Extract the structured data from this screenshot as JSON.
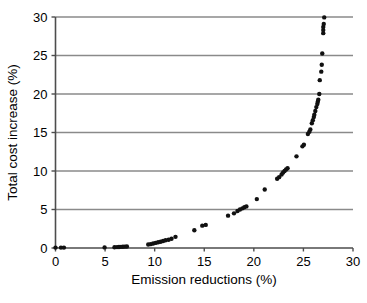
{
  "chart_data": {
    "type": "scatter",
    "title": "",
    "subtitle": "",
    "xlabel": "Emission reductions (%)",
    "ylabel": "Total cost increase (%)",
    "xlim": [
      0,
      30
    ],
    "ylim": [
      0,
      30
    ],
    "xticks": [
      "0",
      "5",
      "10",
      "15",
      "20",
      "25",
      "30"
    ],
    "yticks": [
      "0",
      "5",
      "10",
      "15",
      "20",
      "25",
      "30"
    ],
    "xtick_values": [
      0,
      5,
      10,
      15,
      20,
      25,
      30
    ],
    "ytick_values": [
      0,
      5,
      10,
      15,
      20,
      25,
      30
    ],
    "grid": "horizontal",
    "gridlines_y": [
      5,
      10,
      15,
      20,
      25,
      30
    ],
    "legend": null,
    "legend_position": "none",
    "annotations": [],
    "marker": {
      "shape": "circle",
      "color": "#111111",
      "size_px": 4.4,
      "filled": true
    },
    "axis_color": "#4d4d4d",
    "grid_color": "#8a8a8a",
    "series": [
      {
        "name": "Marginal abatement cost curve",
        "points": [
          [
            0.0,
            0.05
          ],
          [
            0.55,
            0.05
          ],
          [
            0.85,
            0.05
          ],
          [
            4.95,
            0.08
          ],
          [
            5.95,
            0.1
          ],
          [
            6.2,
            0.12
          ],
          [
            6.4,
            0.13
          ],
          [
            6.6,
            0.15
          ],
          [
            6.8,
            0.16
          ],
          [
            7.0,
            0.18
          ],
          [
            7.2,
            0.2
          ],
          [
            9.35,
            0.45
          ],
          [
            9.6,
            0.5
          ],
          [
            9.85,
            0.58
          ],
          [
            10.1,
            0.66
          ],
          [
            10.35,
            0.74
          ],
          [
            10.6,
            0.82
          ],
          [
            10.85,
            0.9
          ],
          [
            11.1,
            1.0
          ],
          [
            11.4,
            1.08
          ],
          [
            11.7,
            1.2
          ],
          [
            12.1,
            1.45
          ],
          [
            14.0,
            2.3
          ],
          [
            14.8,
            2.9
          ],
          [
            15.15,
            3.0
          ],
          [
            17.4,
            4.2
          ],
          [
            18.0,
            4.5
          ],
          [
            18.35,
            4.8
          ],
          [
            18.6,
            5.0
          ],
          [
            18.85,
            5.15
          ],
          [
            19.05,
            5.3
          ],
          [
            19.25,
            5.4
          ],
          [
            20.3,
            6.35
          ],
          [
            21.1,
            7.6
          ],
          [
            22.35,
            9.0
          ],
          [
            22.55,
            9.2
          ],
          [
            22.8,
            9.55
          ],
          [
            22.95,
            9.8
          ],
          [
            23.1,
            10.0
          ],
          [
            23.25,
            10.2
          ],
          [
            23.4,
            10.35
          ],
          [
            24.3,
            11.9
          ],
          [
            24.9,
            13.2
          ],
          [
            25.05,
            13.4
          ],
          [
            25.45,
            14.8
          ],
          [
            25.6,
            15.1
          ],
          [
            25.7,
            15.4
          ],
          [
            25.85,
            16.2
          ],
          [
            25.95,
            16.6
          ],
          [
            26.05,
            17.0
          ],
          [
            26.1,
            17.3
          ],
          [
            26.2,
            17.8
          ],
          [
            26.3,
            18.3
          ],
          [
            26.4,
            18.7
          ],
          [
            26.45,
            19.0
          ],
          [
            26.5,
            19.25
          ],
          [
            26.6,
            20.0
          ],
          [
            26.65,
            21.8
          ],
          [
            26.8,
            22.9
          ],
          [
            26.85,
            23.8
          ],
          [
            26.9,
            25.25
          ],
          [
            27.0,
            27.9
          ],
          [
            27.0,
            28.3
          ],
          [
            27.0,
            28.7
          ],
          [
            27.05,
            29.1
          ],
          [
            27.1,
            29.95
          ]
        ]
      }
    ]
  },
  "axes": {
    "x_label": "Emission reductions (%)",
    "y_label": "Total cost increase (%)"
  }
}
